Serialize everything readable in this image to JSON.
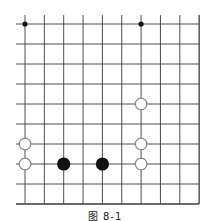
{
  "figure": {
    "caption": "图 8-1",
    "board": {
      "columns": 10,
      "rows": 10,
      "origin_x": 25,
      "origin_y": 24,
      "spacing_x": 19.35,
      "spacing_y": 20,
      "left_overhang": 9,
      "top_overhang": 9,
      "line_color": "#3a3a3a",
      "open_edges": [
        "left",
        "top"
      ],
      "closed_edges": [
        "right",
        "bottom"
      ]
    },
    "star_points": [
      {
        "col": 0,
        "row": 0
      },
      {
        "col": 6,
        "row": 0
      }
    ],
    "stones": [
      {
        "color": "white",
        "col": 6,
        "row": 4
      },
      {
        "color": "white",
        "col": 0,
        "row": 6
      },
      {
        "color": "white",
        "col": 6,
        "row": 6
      },
      {
        "color": "white",
        "col": 0,
        "row": 7
      },
      {
        "color": "white",
        "col": 6,
        "row": 7
      },
      {
        "color": "black",
        "col": 2,
        "row": 7
      },
      {
        "color": "black",
        "col": 4,
        "row": 7
      }
    ],
    "colors": {
      "black_stone": "#111111",
      "white_stone_fill": "#ffffff",
      "white_stone_stroke": "#8a8a8a"
    }
  }
}
